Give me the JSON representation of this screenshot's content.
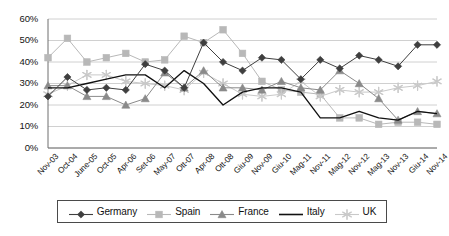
{
  "chart_data": {
    "type": "line",
    "title": "",
    "xlabel": "",
    "ylabel": "",
    "ylim": [
      0,
      60
    ],
    "ytick_step": 10,
    "ytick_labels": [
      "0%",
      "10%",
      "20%",
      "30%",
      "40%",
      "50%",
      "60%"
    ],
    "grid": true,
    "legend_position": "bottom",
    "categories": [
      "Nov-03",
      "Oct-04",
      "June-05",
      "Oct-05",
      "Apr-06",
      "Set-06",
      "May-07",
      "Ott-07",
      "Apr-08",
      "Ott-08",
      "Giu-09",
      "Nov-09",
      "Giu-10",
      "Mag-11",
      "Nov-11",
      "Mag-12",
      "Nov-12",
      "Mag-13",
      "Nov-13",
      "Giu-14",
      "Nov-14"
    ],
    "series": [
      {
        "name": "Germany",
        "color": "#3f3f3f",
        "marker": "diamond",
        "values": [
          24,
          33,
          27,
          28,
          27,
          39,
          36,
          28,
          49,
          40,
          36,
          42,
          41,
          32,
          41,
          37,
          43,
          41,
          38,
          48,
          48
        ]
      },
      {
        "name": "Spain",
        "color": "#b8b8b8",
        "marker": "square",
        "values": [
          42,
          51,
          40,
          42,
          44,
          40,
          41,
          52,
          49,
          55,
          44,
          31,
          27,
          26,
          25,
          14,
          14,
          11,
          12,
          12,
          11
        ]
      },
      {
        "name": "France",
        "color": "#8a8a8a",
        "marker": "triangle",
        "values": [
          29,
          29,
          24,
          24,
          20,
          23,
          35,
          28,
          36,
          28,
          28,
          27,
          31,
          28,
          27,
          36,
          30,
          23,
          13,
          17,
          16
        ]
      },
      {
        "name": "Italy",
        "color": "#111111",
        "marker": "none",
        "values": [
          28,
          28,
          30,
          32,
          34,
          34,
          28,
          36,
          30,
          20,
          26,
          28,
          28,
          26,
          14,
          14,
          17,
          14,
          13,
          17,
          16
        ]
      },
      {
        "name": "UK",
        "color": "#c9c9c9",
        "marker": "asterisk",
        "values": [
          25,
          29,
          34,
          34,
          31,
          30,
          29,
          27,
          35,
          30,
          25,
          24,
          25,
          31,
          24,
          27,
          26,
          26,
          28,
          29,
          31
        ]
      }
    ]
  },
  "legend": {
    "items": [
      {
        "label": "Germany"
      },
      {
        "label": "Spain"
      },
      {
        "label": "France"
      },
      {
        "label": "Italy"
      },
      {
        "label": "UK"
      }
    ]
  }
}
